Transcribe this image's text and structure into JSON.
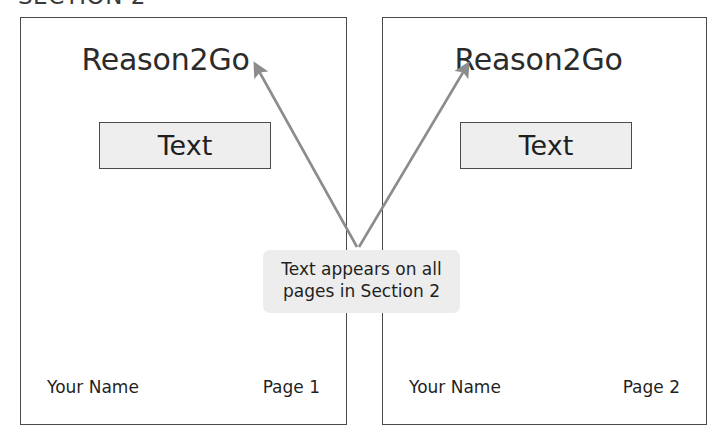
{
  "diagram": {
    "section_heading": "SECTION 2",
    "callout_text": "Text appears on all pages in Section 2",
    "arrow_color": "#8c8c8c",
    "page_border_color": "#4a4a4a",
    "text_box_fill": "#eeeeee",
    "callout_fill": "#ededed"
  },
  "pages": [
    {
      "header": "Reason2Go",
      "body_box_label": "Text",
      "footer_left": "Your Name",
      "footer_right": "Page 1"
    },
    {
      "header": "Reason2Go",
      "body_box_label": "Text",
      "footer_left": "Your Name",
      "footer_right": "Page 2"
    }
  ]
}
